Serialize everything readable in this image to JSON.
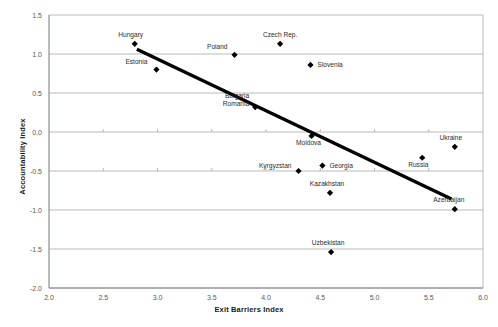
{
  "chart_data": {
    "type": "scatter",
    "title": "",
    "xlabel": "Exit Barriers Index",
    "ylabel": "Accountability Index",
    "xlim": [
      2.0,
      6.0
    ],
    "ylim": [
      -2.0,
      1.5
    ],
    "xticks": [
      "2.0",
      "2.5",
      "3.0",
      "3.5",
      "4.0",
      "4.5",
      "5.0",
      "5.5",
      "6.0"
    ],
    "xtick_values": [
      2.0,
      2.5,
      3.0,
      3.5,
      4.0,
      4.5,
      5.0,
      5.5,
      6.0
    ],
    "yticks": [
      "1.5",
      "1.0",
      "0.5",
      "0.0",
      "-0.5",
      "-1.0",
      "-1.5",
      "-2.0"
    ],
    "ytick_values": [
      1.5,
      1.0,
      0.5,
      0.0,
      -0.5,
      -1.0,
      -1.5,
      -2.0
    ],
    "grid": "horizontal",
    "legend": "none",
    "marker_color": "#000000",
    "gridline_color": "#a7a9ac",
    "trendline_color": "#000000",
    "points": [
      {
        "label": "Hungary",
        "x": 2.79,
        "y": 1.13,
        "label_dx": -4,
        "label_dy": -7,
        "anchor": "middle"
      },
      {
        "label": "Estonia",
        "x": 2.99,
        "y": 0.8,
        "label_dx": -9,
        "label_dy": -6,
        "anchor": "end"
      },
      {
        "label": "Poland",
        "x": 3.71,
        "y": 0.99,
        "label_dx": -7,
        "label_dy": -6,
        "anchor": "end"
      },
      {
        "label": "Czech Rep.",
        "x": 4.13,
        "y": 1.13,
        "label_dx": 0,
        "label_dy": -7,
        "anchor": "middle"
      },
      {
        "label": "Slovenia",
        "x": 4.41,
        "y": 0.86,
        "label_dx": 7,
        "label_dy": 2.5,
        "anchor": "start"
      },
      {
        "label": "Bulgaria",
        "x": 3.9,
        "y": 0.32,
        "label_dx": -6,
        "label_dy": -9,
        "anchor": "end"
      },
      {
        "label": "Romania",
        "x": 3.9,
        "y": 0.32,
        "label_dx": -6,
        "label_dy": -1,
        "anchor": "end"
      },
      {
        "label": "Moldova",
        "x": 4.42,
        "y": -0.05,
        "label_dx": -3,
        "label_dy": 9,
        "anchor": "middle"
      },
      {
        "label": "Kyrgyzstan",
        "x": 4.3,
        "y": -0.5,
        "label_dx": -7,
        "label_dy": -3,
        "anchor": "end"
      },
      {
        "label": "Georgia",
        "x": 4.52,
        "y": -0.43,
        "label_dx": 7,
        "label_dy": 2.5,
        "anchor": "start"
      },
      {
        "label": "Kazakhstan",
        "x": 4.59,
        "y": -0.78,
        "label_dx": -3,
        "label_dy": -7,
        "anchor": "middle"
      },
      {
        "label": "Uzbekistan",
        "x": 4.6,
        "y": -1.54,
        "label_dx": -3,
        "label_dy": -7,
        "anchor": "middle"
      },
      {
        "label": "Russia",
        "x": 5.44,
        "y": -0.33,
        "label_dx": -4,
        "label_dy": 9,
        "anchor": "middle"
      },
      {
        "label": "Ukraine",
        "x": 5.74,
        "y": -0.19,
        "label_dx": -4,
        "label_dy": -7,
        "anchor": "middle"
      },
      {
        "label": "Azerbaijan",
        "x": 5.74,
        "y": -0.99,
        "label_dx": -6,
        "label_dy": -7,
        "anchor": "middle"
      }
    ],
    "trendline": {
      "x1": 2.81,
      "y1": 1.06,
      "x2": 5.71,
      "y2": -0.86
    }
  }
}
